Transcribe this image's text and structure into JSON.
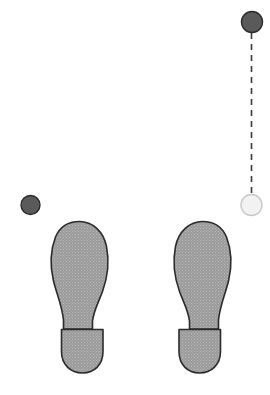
{
  "scene": {
    "title": "Footprint stance diagram",
    "canvas": {
      "width": 270,
      "height": 395
    },
    "background_color": "#ffffff"
  },
  "colors": {
    "footprint_fill": "#9a9a9a",
    "footprint_speckle": "#b5b5b5",
    "footprint_outline": "#2b2b2b",
    "marker_dark_fill": "#5a5a5a",
    "marker_dark_outline": "#2b2b2b",
    "marker_light_fill": "#f2f2f2",
    "marker_light_outline": "#c9c9c9",
    "connector_line": "#3a3a3a"
  },
  "markers": [
    {
      "id": "marker-top-right-dark",
      "label": "dark-marker-top-right",
      "shape": "circle",
      "fill": "#5a5a5a",
      "stroke": "#2b2b2b",
      "cx": 252,
      "cy": 22,
      "r": 10.5
    },
    {
      "id": "marker-left-dark",
      "label": "dark-marker-left",
      "shape": "circle",
      "fill": "#5a5a5a",
      "stroke": "#2b2b2b",
      "cx": 30.5,
      "cy": 205,
      "r": 9.5
    },
    {
      "id": "marker-right-light",
      "label": "light-marker-right",
      "shape": "circle",
      "fill": "#f2f2f2",
      "stroke": "#c9c9c9",
      "cx": 251.5,
      "cy": 205,
      "r": 10.5
    }
  ],
  "connector": {
    "id": "dashed-connector",
    "label": "dashed-vertical-connector",
    "from_marker": "marker-top-right-dark",
    "to_marker": "marker-right-light",
    "x": 251.5,
    "y1": 33,
    "y2": 194,
    "stroke": "#3a3a3a",
    "stroke_width": 1.6,
    "dash_pattern": "6 5"
  },
  "footprints": [
    {
      "id": "footprint-left",
      "label": "left-footprint",
      "side": "left",
      "mirrored": false,
      "bounds": {
        "x": 49,
        "y": 220,
        "width": 60,
        "height": 154
      },
      "sole_path": "M 79.5 221.5 C 92.5 221.5 103.5 231.5 106.5 246.5 C 109.5 261.5 107.5 277.5 102.5 291.5 C 98.5 302.5 94.0 309.5 92.5 321.0 L 92.5 329.0 L 63.5 329.0 L 63.5 320.0 C 62.0 305.0 56.5 293.5 53.5 281.0 C 50.0 266.5 50.5 250.0 55.5 237.0 C 60.0 226.5 69.0 221.5 79.5 221.5 Z",
      "heel_path": "M 61.5 329.5 L 103.0 329.5 L 103.0 351.5 C 103.0 364.5 94.5 373.0 82.5 373.0 C 70.5 373.0 61.5 364.5 61.5 351.5 Z"
    },
    {
      "id": "footprint-right",
      "label": "right-footprint",
      "side": "right",
      "mirrored": true,
      "bounds": {
        "x": 172,
        "y": 220,
        "width": 60,
        "height": 154
      },
      "sole_path": "M 79.5 221.5 C 92.5 221.5 103.5 231.5 106.5 246.5 C 109.5 261.5 107.5 277.5 102.5 291.5 C 98.5 302.5 94.0 309.5 92.5 321.0 L 92.5 329.0 L 63.5 329.0 L 63.5 320.0 C 62.0 305.0 56.5 293.5 53.5 281.0 C 50.0 266.5 50.5 250.0 55.5 237.0 C 60.0 226.5 69.0 221.5 79.5 221.5 Z",
      "heel_path": "M 61.5 329.5 L 103.0 329.5 L 103.0 351.5 C 103.0 364.5 94.5 373.0 82.5 373.0 C 70.5 373.0 61.5 364.5 61.5 351.5 Z"
    }
  ]
}
